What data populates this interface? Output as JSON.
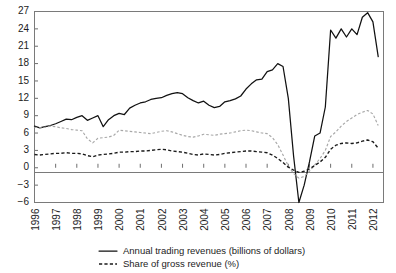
{
  "chart_data": {
    "type": "line",
    "title": "",
    "subtitle": "",
    "xlabel": "",
    "ylabel": "",
    "xlim": [
      1996,
      2012.5
    ],
    "ylim": [
      -6,
      27
    ],
    "ytick_values": [
      27,
      24,
      21,
      18,
      15,
      12,
      9,
      6,
      3,
      0,
      -3,
      -6
    ],
    "ytick_labels": [
      "27",
      "24",
      "21",
      "18",
      "15",
      "12",
      "9",
      "6",
      "3",
      "0",
      "−3",
      "−6"
    ],
    "xtick_values": [
      1996,
      1997,
      1998,
      1999,
      2000,
      2001,
      2002,
      2003,
      2004,
      2005,
      2006,
      2007,
      2008,
      2009,
      2010,
      2011,
      2012
    ],
    "xtick_labels": [
      "1996",
      "1997",
      "1998",
      "1999",
      "2000",
      "2001",
      "2002",
      "2003",
      "2004",
      "2005",
      "2006",
      "2007",
      "2008",
      "2009",
      "2010",
      "2011",
      "2012"
    ],
    "grid": false,
    "zero_line": true,
    "legend_position": "bottom",
    "legend": [
      {
        "key": "annual_trading_revenues",
        "label": "Annual trading revenues (billions of dollars)",
        "style": "solid",
        "color": "#111111"
      },
      {
        "key": "share_of_gross_revenue",
        "label": "Share of gross revenue (%)",
        "style": "dashed",
        "color": "#1a1a1a"
      }
    ],
    "x": [
      1996.0,
      1996.25,
      1996.5,
      1996.75,
      1997.0,
      1997.25,
      1997.5,
      1997.75,
      1998.0,
      1998.25,
      1998.5,
      1998.75,
      1999.0,
      1999.25,
      1999.5,
      1999.75,
      2000.0,
      2000.25,
      2000.5,
      2000.75,
      2001.0,
      2001.25,
      2001.5,
      2001.75,
      2002.0,
      2002.25,
      2002.5,
      2002.75,
      2003.0,
      2003.25,
      2003.5,
      2003.75,
      2004.0,
      2004.25,
      2004.5,
      2004.75,
      2005.0,
      2005.25,
      2005.5,
      2005.75,
      2006.0,
      2006.25,
      2006.5,
      2006.75,
      2007.0,
      2007.25,
      2007.5,
      2007.75,
      2008.0,
      2008.25,
      2008.5,
      2008.75,
      2009.0,
      2009.25,
      2009.5,
      2009.75,
      2010.0,
      2010.25,
      2010.5,
      2010.75,
      2011.0,
      2011.25,
      2011.5,
      2011.75,
      2012.0,
      2012.25
    ],
    "series": [
      {
        "name": "Annual trading revenues (billions of dollars)",
        "style": "solid",
        "color": "#111111",
        "values": [
          7.2,
          6.9,
          7.1,
          7.3,
          7.6,
          8.0,
          8.4,
          8.3,
          8.7,
          9.0,
          8.2,
          8.6,
          9.0,
          7.1,
          8.3,
          9.0,
          9.4,
          9.2,
          10.3,
          10.8,
          11.2,
          11.4,
          11.8,
          12.0,
          12.1,
          12.5,
          12.8,
          13.0,
          12.8,
          12.1,
          11.6,
          11.2,
          11.5,
          10.8,
          10.4,
          10.6,
          11.4,
          11.6,
          11.9,
          12.4,
          13.6,
          14.5,
          15.2,
          15.3,
          16.6,
          16.9,
          18.0,
          17.5,
          12.0,
          2.0,
          -6.0,
          -3.0,
          1.0,
          5.5,
          6.0,
          10.5,
          23.8,
          22.4,
          24.0,
          22.6,
          24.0,
          23.0,
          26.0,
          26.8,
          25.2,
          19.2
        ]
      },
      {
        "name": "Share of gross revenue (%) – upper",
        "style": "dotted-light",
        "color": "#a8a8a8",
        "values": [
          7.0,
          6.9,
          7.0,
          7.2,
          7.1,
          6.9,
          6.8,
          6.6,
          6.5,
          6.4,
          5.0,
          4.3,
          5.1,
          5.2,
          5.3,
          5.6,
          6.5,
          6.4,
          6.3,
          6.2,
          6.1,
          6.0,
          5.9,
          6.1,
          6.3,
          6.4,
          6.2,
          5.9,
          5.6,
          5.4,
          5.3,
          5.5,
          5.8,
          5.7,
          5.6,
          5.8,
          5.9,
          6.0,
          6.2,
          6.4,
          6.5,
          6.4,
          6.2,
          6.0,
          5.9,
          5.2,
          4.0,
          2.2,
          0.3,
          -1.0,
          -1.8,
          -1.5,
          -0.6,
          0.5,
          1.6,
          3.0,
          5.4,
          6.2,
          7.2,
          8.0,
          8.6,
          9.2,
          9.6,
          9.9,
          9.3,
          7.3
        ]
      },
      {
        "name": "Share of gross revenue (%) – lower",
        "style": "dashed-dark",
        "color": "#1a1a1a",
        "values": [
          2.3,
          2.2,
          2.3,
          2.4,
          2.5,
          2.5,
          2.6,
          2.5,
          2.5,
          2.4,
          2.1,
          1.9,
          2.2,
          2.3,
          2.4,
          2.5,
          2.7,
          2.7,
          2.8,
          2.8,
          2.9,
          2.9,
          3.0,
          3.1,
          3.2,
          3.1,
          2.9,
          2.8,
          2.7,
          2.5,
          2.3,
          2.2,
          2.4,
          2.3,
          2.2,
          2.3,
          2.5,
          2.6,
          2.7,
          2.8,
          2.9,
          2.9,
          2.8,
          2.7,
          2.6,
          2.2,
          1.6,
          0.9,
          0.1,
          -0.4,
          -0.8,
          -0.6,
          -0.2,
          0.4,
          1.0,
          1.8,
          3.2,
          3.9,
          4.2,
          4.3,
          4.2,
          4.3,
          4.6,
          4.8,
          4.5,
          3.4
        ]
      }
    ]
  }
}
